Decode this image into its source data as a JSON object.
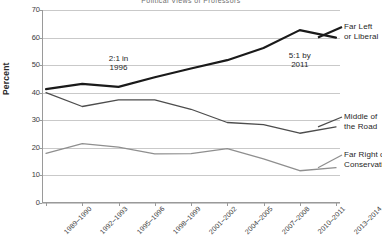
{
  "chart_data": {
    "type": "line",
    "title": "Political Views of Professors",
    "xlabel": "",
    "ylabel": "Percent",
    "ylim": [
      0,
      70
    ],
    "ytick_step": 10,
    "yticks": [
      0,
      10,
      20,
      30,
      40,
      50,
      60,
      70
    ],
    "grid": true,
    "legend_position": "right-inline",
    "categories": [
      "1989–1990",
      "1992–1993",
      "1995–1996",
      "1998–1999",
      "2001–2002",
      "2004–2005",
      "2007–2008",
      "2010–2011",
      "2013–2014"
    ],
    "series": [
      {
        "name": "Far Left or Liberal",
        "color": "#1a1a1a",
        "width": 2.2,
        "values": [
          41.3,
          43.2,
          42.1,
          45.6,
          48.8,
          51.8,
          56.2,
          62.7,
          60.0
        ]
      },
      {
        "name": "Middle of the Road",
        "color": "#4d4d4d",
        "width": 1.3,
        "values": [
          40.0,
          35.0,
          37.4,
          37.4,
          34.0,
          29.2,
          28.4,
          25.3,
          27.6
        ]
      },
      {
        "name": "Far Right or Conservative",
        "color": "#8f8f8f",
        "width": 1.3,
        "values": [
          18.0,
          21.5,
          20.3,
          17.8,
          17.9,
          19.7,
          16.0,
          11.7,
          12.8
        ]
      }
    ],
    "annotations": [
      {
        "text": "2:1 in\n1996",
        "x_category": "1995–1996",
        "y_value": 52
      },
      {
        "text": "5:1 by\n2011",
        "x_category": "2010–2011",
        "y_value": 53
      }
    ],
    "series_end_labels": [
      {
        "text": "Far Left\nor Liberal",
        "series": "Far Left or Liberal"
      },
      {
        "text": "Middle of\nthe Road",
        "series": "Middle of the Road"
      },
      {
        "text": "Far Right or\nConservative",
        "series": "Far Right or Conservative"
      }
    ],
    "colors": {
      "gridline": "#c9c9c9",
      "axis": "#9a9a9a",
      "background": "#ffffff",
      "text": "#1f1f1f"
    }
  }
}
